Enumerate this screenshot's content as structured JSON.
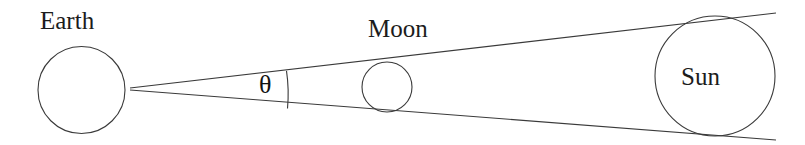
{
  "figure": {
    "background_color": "#ffffff",
    "stroke_color": "#3a3a3a",
    "text_color": "#1c1c1c",
    "width": 805,
    "height": 145
  },
  "labels": {
    "earth": "Earth",
    "moon": "Moon",
    "sun": "Sun",
    "angle": "θ"
  },
  "bodies": {
    "earth": {
      "name": "Earth",
      "cx": 81.5,
      "cy": 90,
      "r": 43.5
    },
    "moon": {
      "name": "Moon",
      "cx": 387,
      "cy": 87,
      "r": 25
    },
    "sun": {
      "name": "Sun",
      "cx": 715,
      "cy": 76,
      "r": 60
    }
  },
  "geometry": {
    "apex": {
      "x": 130,
      "y": 89
    },
    "upper_tangent": {
      "x1": 130,
      "y1": 89,
      "x2": 775,
      "y2": 13
    },
    "lower_tangent": {
      "x1": 130,
      "y1": 89,
      "x2": 775,
      "y2": 140
    },
    "angle_arc": {
      "cx": 130,
      "cy": 89,
      "radius": 158
    }
  }
}
